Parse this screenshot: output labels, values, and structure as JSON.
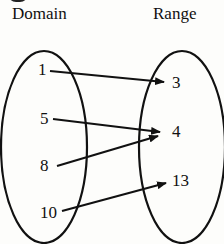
{
  "diagram": {
    "type": "mapping-diagram",
    "domain_label": "Domain",
    "range_label": "Range",
    "domain": [
      "1",
      "5",
      "8",
      "10"
    ],
    "range": [
      "3",
      "4",
      "13"
    ],
    "mappings": [
      {
        "from": "1",
        "to": "3"
      },
      {
        "from": "5",
        "to": "4"
      },
      {
        "from": "8",
        "to": "4"
      },
      {
        "from": "10",
        "to": "13"
      }
    ],
    "line_color": "#111111"
  }
}
